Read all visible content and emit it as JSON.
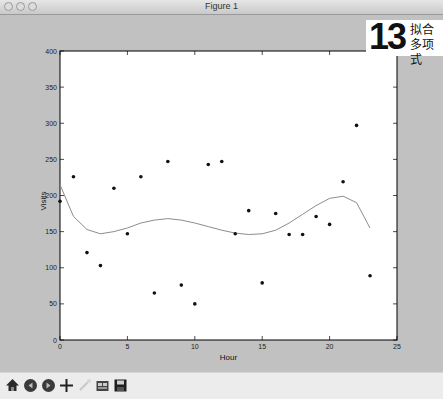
{
  "window": {
    "title": "Figure 1"
  },
  "badge": {
    "number": "13",
    "line1": "拟合",
    "line2": "多项式"
  },
  "toolbar": {
    "buttons": [
      {
        "name": "home-button",
        "icon": "home-icon"
      },
      {
        "name": "back-button",
        "icon": "back-arrow-icon"
      },
      {
        "name": "forward-button",
        "icon": "forward-arrow-icon"
      },
      {
        "name": "pan-button",
        "icon": "move-icon"
      },
      {
        "name": "zoom-button",
        "icon": "zoom-rect-icon"
      },
      {
        "name": "subplots-button",
        "icon": "subplots-icon"
      },
      {
        "name": "save-button",
        "icon": "save-icon"
      }
    ]
  },
  "chart_data": {
    "type": "scatter",
    "title": "",
    "xlabel": "Hour",
    "ylabel": "Visits",
    "xlim": [
      0,
      25
    ],
    "ylim": [
      0,
      400
    ],
    "xticks": [
      0,
      5,
      10,
      15,
      20,
      25
    ],
    "yticks": [
      0,
      50,
      100,
      150,
      200,
      250,
      300,
      350,
      400
    ],
    "grid": false,
    "legend": null,
    "series": [
      {
        "name": "data points",
        "kind": "scatter",
        "x": [
          0,
          1,
          2,
          3,
          4,
          5,
          6,
          7,
          8,
          9,
          10,
          11,
          12,
          13,
          14,
          15,
          16,
          17,
          18,
          19,
          20,
          21,
          22,
          23
        ],
        "y": [
          192,
          226,
          121,
          103,
          210,
          147,
          226,
          65,
          247,
          76,
          50,
          243,
          247,
          147,
          179,
          79,
          175,
          146,
          146,
          171,
          160,
          219,
          297,
          89
        ]
      },
      {
        "name": "polynomial fit",
        "kind": "line",
        "x": [
          0,
          1,
          2,
          3,
          4,
          5,
          6,
          7,
          8,
          9,
          10,
          11,
          12,
          13,
          14,
          15,
          16,
          17,
          18,
          19,
          20,
          21,
          22,
          23
        ],
        "y": [
          215,
          171,
          153,
          147,
          150,
          155,
          162,
          166,
          168,
          166,
          162,
          157,
          152,
          148,
          146,
          147,
          152,
          162,
          174,
          186,
          196,
          199,
          190,
          155
        ]
      }
    ]
  }
}
